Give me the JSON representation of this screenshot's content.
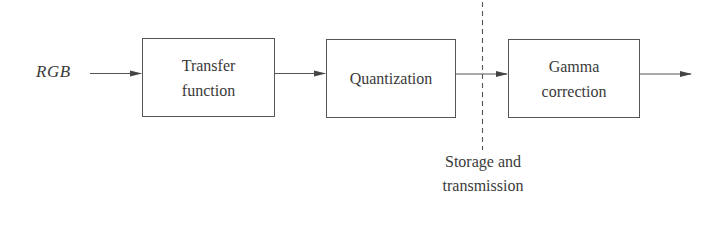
{
  "diagram": {
    "input_label": "RGB",
    "blocks": [
      {
        "line1": "Transfer",
        "line2": "function"
      },
      {
        "line1": "Quantization",
        "line2": ""
      },
      {
        "line1": "Gamma",
        "line2": "correction"
      }
    ],
    "divider_label": {
      "line1": "Storage and",
      "line2": "transmission"
    },
    "colors": {
      "stroke": "#555555",
      "text": "#3a3a3a",
      "background": "#ffffff"
    }
  }
}
